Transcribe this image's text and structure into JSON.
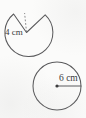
{
  "figure": {
    "background_color": "#fbfbfa",
    "stroke_color": "#5a5a5c",
    "label_color": "#3a3a3c",
    "shapes": {
      "top": {
        "name": "circle-with-wedge-removed",
        "center_x": 28,
        "center_y": 36,
        "radius": 24,
        "wedge_removed": true,
        "wedge_opening_direction": "up",
        "radius_line_style": "dashed",
        "label": "4 cm",
        "label_x": 7,
        "label_y": 35
      },
      "bottom": {
        "name": "full-circle",
        "center_x": 57,
        "center_y": 86,
        "radius": 24,
        "wedge_removed": false,
        "center_dot": true,
        "radius_line_style": "solid",
        "radius_line_direction": "right",
        "label": "6 cm",
        "label_x": 60,
        "label_y": 81
      }
    }
  }
}
